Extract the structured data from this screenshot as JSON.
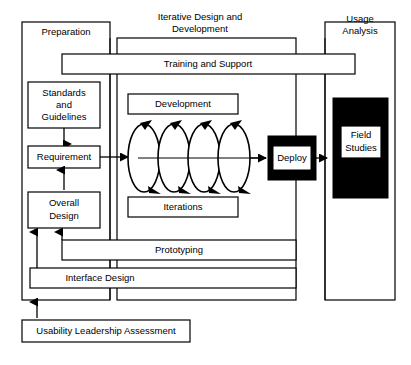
{
  "diagram": {
    "type": "process-flow-diagram",
    "background_color": "#ffffff",
    "line_color": "#000000",
    "columns": [
      {
        "id": "preparation",
        "label": "Preparation"
      },
      {
        "id": "iterative-design-development",
        "label": "Iterative Design and\nDevelopment",
        "label_line1": "Iterative Design and",
        "label_line2": "Development"
      },
      {
        "id": "usage-analysis",
        "label": "Usage\nAnalysis",
        "label_line1": "Usage",
        "label_line2": "Analysis"
      }
    ],
    "preparation_boxes": [
      {
        "id": "standards-and-guidelines",
        "line1": "Standards",
        "line2": "and",
        "line3": "Guidelines"
      },
      {
        "id": "requirement",
        "line1": "Requirement"
      },
      {
        "id": "overall-design",
        "line1": "Overall",
        "line2": "Design"
      }
    ],
    "iterative_boxes": [
      {
        "id": "development",
        "label": "Development"
      },
      {
        "id": "iterations",
        "label": "Iterations"
      }
    ],
    "loop_count": 4,
    "deploy": {
      "id": "deploy",
      "label": "Deploy",
      "fill": "#000000",
      "text_fill": "#ffffff"
    },
    "usage_analysis_block": {
      "id": "field-studies",
      "line1": "Field",
      "line2": "Studies",
      "block_fill": "#000000",
      "inner_fill": "#ffffff"
    },
    "spanning_bars": [
      {
        "id": "training-and-support",
        "label": "Training and Support"
      },
      {
        "id": "prototyping",
        "label": "Prototyping"
      },
      {
        "id": "interface-design",
        "label": "Interface Design"
      }
    ],
    "footer_box": {
      "id": "usability-leadership-assessment",
      "label": "Usability Leadership Assessment"
    }
  }
}
